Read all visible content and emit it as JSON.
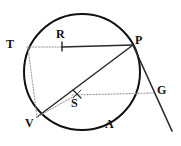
{
  "figure": {
    "kind": "circle-geometry-diagram",
    "width": 181,
    "height": 146,
    "background_color": "#ffffff",
    "ink_color": "#1a1a1a",
    "faint_ink_color": "#8a8a8a"
  },
  "circle": {
    "label": "circle",
    "center_x": 82,
    "center_y": 72,
    "radius": 58,
    "stroke_color": "#111111",
    "stroke_width": 2.0,
    "fill": "none"
  },
  "points": [
    {
      "id": "T",
      "label": "T",
      "x": 27,
      "y": 47,
      "label_x": 6,
      "label_y": 38,
      "on_circle": true
    },
    {
      "id": "R",
      "label": "R",
      "x": 62,
      "y": 47,
      "label_x": 56,
      "label_y": 28,
      "on_circle": false
    },
    {
      "id": "P",
      "label": "P",
      "x": 133,
      "y": 45,
      "label_x": 135,
      "label_y": 34,
      "on_circle": true
    },
    {
      "id": "S",
      "label": "S",
      "x": 77,
      "y": 95,
      "label_x": 71,
      "label_y": 97,
      "on_circle": false
    },
    {
      "id": "V",
      "label": "V",
      "x": 37,
      "y": 117,
      "label_x": 25,
      "label_y": 117,
      "on_circle": true
    },
    {
      "id": "A",
      "label": "A",
      "x": 108,
      "y": 128,
      "label_x": 105,
      "label_y": 118,
      "on_circle": true
    },
    {
      "id": "G",
      "label": "G",
      "x": 152,
      "y": 94,
      "label_x": 157,
      "label_y": 84,
      "on_circle": false
    }
  ],
  "segments": [
    {
      "id": "TR",
      "from": "T",
      "to": "R",
      "style": "dotted",
      "note": "faint chord extension from T to R"
    },
    {
      "id": "RP",
      "from": "R",
      "to": "P",
      "style": "solid",
      "note": "solid chord from R to P"
    },
    {
      "id": "PV",
      "from": "P",
      "to": "V",
      "style": "solid",
      "note": "solid chord from P through near S to V"
    },
    {
      "id": "TV",
      "from": "T",
      "to": "V",
      "style": "dotted",
      "note": "faint chord from T down to V"
    },
    {
      "id": "VS",
      "from": "V",
      "to": "S",
      "style": "dotted",
      "note": "faint radius from V to center S"
    },
    {
      "id": "SG",
      "from": "S",
      "to": "G",
      "style": "dotted",
      "note": "faint horizontal line from center S out to G"
    },
    {
      "id": "PG",
      "from": "P",
      "to": "G",
      "style": "solid",
      "note": "tangent at P continuing past G"
    }
  ],
  "tangent_line": {
    "id": "tangent-at-P",
    "x1": 133,
    "y1": 45,
    "x2": 172,
    "y2": 131,
    "style": "solid"
  },
  "tick_marks": [
    {
      "id": "R-tick",
      "at": "R",
      "orientation": "vertical",
      "length": 8
    },
    {
      "id": "S-tick",
      "at": "S",
      "orientation": "slash",
      "length": 9
    }
  ]
}
